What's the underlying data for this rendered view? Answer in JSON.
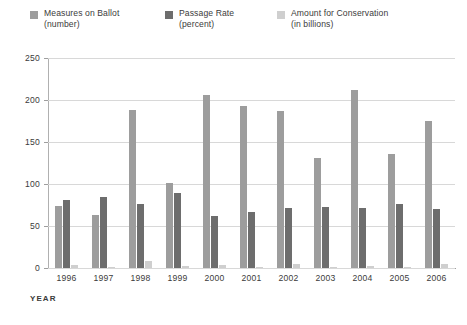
{
  "chart_data": {
    "type": "bar",
    "title": "",
    "xlabel": "YEAR",
    "ylabel": "",
    "ylim": [
      0,
      250
    ],
    "yticks": [
      0,
      50,
      100,
      150,
      200,
      250
    ],
    "grid": true,
    "legend_position": "top",
    "categories": [
      "1996",
      "1997",
      "1998",
      "1999",
      "2000",
      "2001",
      "2002",
      "2003",
      "2004",
      "2005",
      "2006"
    ],
    "series": [
      {
        "name": "Measures on Ballot",
        "unit": "(number)",
        "color": "#9d9d9d",
        "values": [
          74,
          63,
          188,
          101,
          206,
          193,
          187,
          131,
          212,
          136,
          175
        ]
      },
      {
        "name": "Passage Rate",
        "unit": "(percent)",
        "color": "#6d6d6d",
        "values": [
          81,
          84,
          76,
          89,
          62,
          67,
          72,
          73,
          72,
          76,
          70
        ]
      },
      {
        "name": "Amount for Conservation",
        "unit": "(in billions)",
        "color": "#cfcfcf",
        "values": [
          3,
          1,
          8,
          2,
          4,
          1,
          5,
          1,
          2,
          1,
          5
        ]
      }
    ]
  },
  "legend": {
    "items": [
      {
        "label": "Measures on Ballot",
        "sub": "(number)",
        "color": "#9d9d9d",
        "swatch_name": "legend-swatch-measures"
      },
      {
        "label": "Passage Rate",
        "sub": "(percent)",
        "color": "#6d6d6d",
        "swatch_name": "legend-swatch-passage"
      },
      {
        "label": "Amount for Conservation",
        "sub": "(in billions)",
        "color": "#cfcfcf",
        "swatch_name": "legend-swatch-amount"
      }
    ]
  },
  "axis": {
    "x_title": "YEAR",
    "y_max_label": "250",
    "y_min_label": "0"
  }
}
